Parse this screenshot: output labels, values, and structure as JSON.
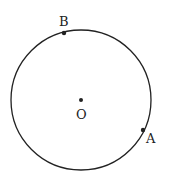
{
  "diagram": {
    "type": "circle-with-points",
    "colors": {
      "stroke": "#222222",
      "background": "#ffffff"
    },
    "circle": {
      "center": {
        "label": "O",
        "x": 81,
        "y": 100
      },
      "radius": 70
    },
    "points": [
      {
        "label": "B",
        "x": 64,
        "y": 33,
        "label_x": 59,
        "label_y": 26
      },
      {
        "label": "A",
        "x": 143,
        "y": 130,
        "label_x": 146,
        "label_y": 143
      }
    ],
    "center_label": {
      "text": "O",
      "x": 76,
      "y": 119
    }
  }
}
